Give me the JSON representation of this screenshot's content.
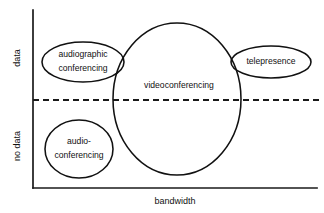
{
  "diagram": {
    "type": "scatter-bubble",
    "axes": {
      "x": {
        "label": "bandwidth",
        "label_x": 175,
        "label_y": 202,
        "line": {
          "x1": 33,
          "y1": 188,
          "x2": 317,
          "y2": 188
        }
      },
      "y": {
        "line": {
          "x1": 33,
          "y1": 10,
          "x2": 33,
          "y2": 188
        },
        "categories": [
          {
            "name": "data-region-label",
            "label": "data",
            "x": 18,
            "y": 58
          },
          {
            "name": "no-data-region-label",
            "label": "no data",
            "x": 18,
            "y": 146
          }
        ]
      }
    },
    "divider": {
      "name": "data-threshold-divider",
      "x1": 33,
      "y1": 100,
      "x2": 322,
      "y2": 100
    },
    "bubbles": [
      {
        "id": "audiographic-conferencing",
        "cx": 83,
        "cy": 62,
        "rx": 41,
        "ry": 20,
        "lines": [
          "audiographic",
          "conferencing"
        ],
        "line_offsets": [
          -7,
          7
        ]
      },
      {
        "id": "videoconferencing",
        "cx": 177,
        "cy": 99,
        "rx": 64,
        "ry": 76,
        "lines": [
          "videoconferencing"
        ],
        "line_offsets": [
          -13
        ]
      },
      {
        "id": "telepresence",
        "cx": 271,
        "cy": 62,
        "rx": 40,
        "ry": 16,
        "lines": [
          "telepresence"
        ],
        "line_offsets": [
          0
        ]
      },
      {
        "id": "audio-conferencing",
        "cx": 79,
        "cy": 149,
        "rx": 34,
        "ry": 29,
        "lines": [
          "audio-",
          "conferencing"
        ],
        "line_offsets": [
          -7,
          7
        ]
      }
    ],
    "colors": {
      "stroke": "#111111",
      "background": "#ffffff",
      "axis": "#1a1a1a"
    }
  }
}
